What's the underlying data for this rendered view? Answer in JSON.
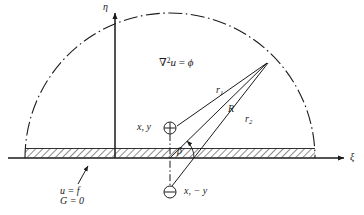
{
  "figure": {
    "domain_type": "diagram",
    "colors": {
      "line": "#1a1a1a",
      "label": "#1a1a1a",
      "background": "#ffffff"
    }
  },
  "axes": {
    "vertical": {
      "label": "η",
      "name": "eta-axis",
      "x": 115,
      "y_top": 12,
      "y_bottom": 158
    },
    "horizontal": {
      "label": "ξ",
      "name": "xi-axis",
      "y": 158,
      "x_left": 8,
      "x_right": 345
    }
  },
  "region": {
    "equation_symbol": "∇",
    "equation_power": "2",
    "equation_var": "u",
    "equation_eq": " = ",
    "equation_rhs": "ϕ",
    "equation_full": "∇2u = ϕ"
  },
  "boundary": {
    "condition_u": "u = f",
    "condition_u_lhs": "u",
    "condition_u_rhs": "f",
    "condition_G": "G = 0",
    "condition_G_lhs": "G",
    "condition_G_rhs": "0",
    "hatch_x_start": 25,
    "hatch_x_end": 315,
    "arc_radius": 145
  },
  "points": {
    "source": {
      "label": "x, y",
      "symbol": "⊕",
      "symbol_name": "circled-plus",
      "x": 170,
      "y": 128
    },
    "image": {
      "label": "x, − y",
      "symbol": "⊖",
      "symbol_name": "circled-minus",
      "x": 170,
      "y": 192
    },
    "field": {
      "label": "",
      "x": 268,
      "y": 62
    },
    "foot": {
      "x": 170,
      "y": 158
    }
  },
  "distances": {
    "r1_base": "r",
    "r1_sub": "1",
    "r1": "r1",
    "R": "R",
    "r2_base": "r",
    "r2_sub": "2",
    "r2": "r2"
  },
  "angle": {
    "label": "β",
    "name": "beta-angle",
    "vertex_x": 170,
    "vertex_y": 158
  }
}
